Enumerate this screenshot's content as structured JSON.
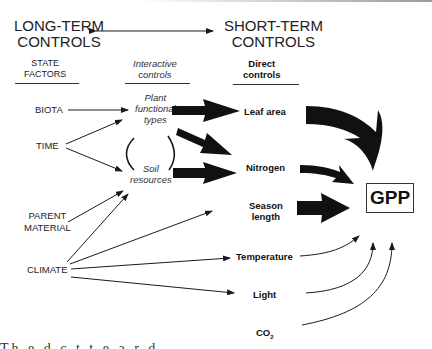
{
  "headers": {
    "long_term_line1": "LONG-TERM",
    "long_term_line2": "CONTROLS",
    "short_term_line1": "SHORT-TERM",
    "short_term_line2": "CONTROLS"
  },
  "columns": {
    "state_factors_line1": "STATE",
    "state_factors_line2": "FACTORS",
    "interactive_line1": "Interactive",
    "interactive_line2": "controls",
    "direct_line1": "Direct",
    "direct_line2": "controls"
  },
  "state_factors": {
    "biota": "BIOTA",
    "time": "TIME",
    "parent_line1": "PARENT",
    "parent_line2": "MATERIAL",
    "climate": "CLIMATE"
  },
  "interactive": {
    "pft_line1": "Plant",
    "pft_line2": "functional",
    "pft_line3": "types",
    "soil_line1": "Soil",
    "soil_line2": "resources"
  },
  "direct": {
    "leaf_area": "Leaf area",
    "nitrogen": "Nitrogen",
    "season_line1": "Season",
    "season_line2": "length",
    "temperature": "Temperature",
    "light": "Light",
    "co2_base": "CO",
    "co2_sub": "2"
  },
  "outcome": {
    "gpp": "GPP"
  },
  "footer": {
    "cut_text": "Th  e  d  c  t  t  e  a  r  d"
  }
}
